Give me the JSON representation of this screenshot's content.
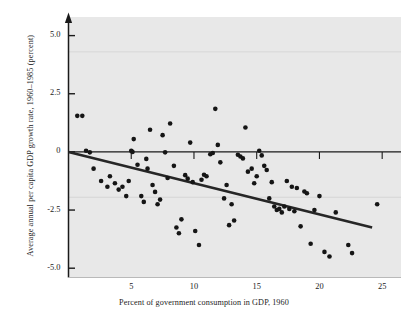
{
  "figure": {
    "background_color": "#ffffff",
    "plot_background_color": "#e8e8e8",
    "axis_color": "#1a1a1a",
    "point_color": "#151515",
    "trendline_color": "#262626",
    "gridline_color": "#d2d2d2"
  },
  "chart_data": {
    "type": "scatter",
    "title": "",
    "subtitle": "",
    "xlabel": "Percent of government consumption in GDP, 1960",
    "ylabel": "Average annual per capita GDP growth rate, 1960–1985 (percent)",
    "xlim": [
      0,
      26.5
    ],
    "ylim": [
      -5.4,
      5.8
    ],
    "xticks": [
      5,
      10,
      15,
      20,
      25
    ],
    "xtick_labels": [
      "5",
      "10",
      "15",
      "20",
      "25"
    ],
    "yticks": [
      5.0,
      2.5,
      0,
      -2.5,
      -5.0
    ],
    "ytick_labels": [
      "5.0",
      "2.5",
      "0",
      "-2.5",
      "-5.0"
    ],
    "grid": false,
    "faint_horizontal_gridlines_at": [
      4.3,
      -1.95
    ],
    "legend": null,
    "legend_position": "none",
    "zero_line": true,
    "y_axis_arrow": true,
    "annotations": [],
    "series": [
      {
        "name": "Countries",
        "marker": "filled-circle",
        "marker_size_px": 3.6,
        "points": [
          [
            0.7,
            1.55
          ],
          [
            1.1,
            1.55
          ],
          [
            1.4,
            0.05
          ],
          [
            1.7,
            -0.02
          ],
          [
            2.0,
            -0.72
          ],
          [
            2.6,
            -1.25
          ],
          [
            3.1,
            -1.5
          ],
          [
            3.3,
            -1.05
          ],
          [
            3.7,
            -1.35
          ],
          [
            4.0,
            -1.62
          ],
          [
            4.3,
            -1.5
          ],
          [
            4.6,
            -1.9
          ],
          [
            4.8,
            -1.25
          ],
          [
            5.0,
            0.05
          ],
          [
            5.1,
            0.0
          ],
          [
            5.2,
            0.55
          ],
          [
            5.5,
            -0.55
          ],
          [
            5.8,
            -1.9
          ],
          [
            6.0,
            -2.15
          ],
          [
            6.2,
            -0.3
          ],
          [
            6.3,
            -0.72
          ],
          [
            6.5,
            0.95
          ],
          [
            6.7,
            -1.42
          ],
          [
            6.9,
            -1.72
          ],
          [
            7.1,
            -2.25
          ],
          [
            7.3,
            -2.05
          ],
          [
            7.5,
            0.72
          ],
          [
            7.7,
            -0.02
          ],
          [
            7.9,
            -1.12
          ],
          [
            8.1,
            1.22
          ],
          [
            8.4,
            -0.6
          ],
          [
            8.6,
            -3.25
          ],
          [
            8.8,
            -3.5
          ],
          [
            9.0,
            -2.9
          ],
          [
            9.3,
            -1.0
          ],
          [
            9.5,
            -1.15
          ],
          [
            9.7,
            0.4
          ],
          [
            9.9,
            -1.3
          ],
          [
            10.1,
            -3.4
          ],
          [
            10.4,
            -4.0
          ],
          [
            10.6,
            -1.2
          ],
          [
            10.8,
            -0.98
          ],
          [
            11.0,
            -1.05
          ],
          [
            11.3,
            -0.1
          ],
          [
            11.5,
            -0.05
          ],
          [
            11.7,
            1.85
          ],
          [
            11.9,
            0.3
          ],
          [
            12.1,
            -0.45
          ],
          [
            12.4,
            -2.0
          ],
          [
            12.6,
            -1.42
          ],
          [
            12.8,
            -3.15
          ],
          [
            13.0,
            -2.25
          ],
          [
            13.2,
            -2.95
          ],
          [
            13.5,
            -0.12
          ],
          [
            13.7,
            -0.2
          ],
          [
            13.9,
            -0.28
          ],
          [
            14.1,
            1.05
          ],
          [
            14.3,
            -0.85
          ],
          [
            14.6,
            -0.72
          ],
          [
            14.8,
            -1.35
          ],
          [
            15.0,
            -1.05
          ],
          [
            15.2,
            0.05
          ],
          [
            15.4,
            -0.15
          ],
          [
            15.6,
            -0.6
          ],
          [
            15.8,
            -0.78
          ],
          [
            16.0,
            -2.0
          ],
          [
            16.2,
            -1.3
          ],
          [
            16.4,
            -2.35
          ],
          [
            16.6,
            -2.5
          ],
          [
            16.8,
            -2.45
          ],
          [
            17.0,
            -2.6
          ],
          [
            17.2,
            -2.35
          ],
          [
            17.4,
            -1.25
          ],
          [
            17.6,
            -2.45
          ],
          [
            17.8,
            -1.5
          ],
          [
            18.0,
            -2.55
          ],
          [
            18.2,
            -1.55
          ],
          [
            18.5,
            -3.2
          ],
          [
            18.8,
            -1.7
          ],
          [
            19.0,
            -1.78
          ],
          [
            19.3,
            -3.95
          ],
          [
            19.6,
            -2.5
          ],
          [
            20.0,
            -1.9
          ],
          [
            20.4,
            -4.3
          ],
          [
            20.8,
            -4.5
          ],
          [
            21.3,
            -2.6
          ],
          [
            22.3,
            -4.0
          ],
          [
            22.6,
            -4.35
          ],
          [
            24.6,
            -2.25
          ]
        ]
      }
    ],
    "trendline": {
      "name": "Fitted regression line",
      "x_start": 0,
      "y_start": 0.0,
      "x_end": 24.2,
      "y_end": -3.25,
      "slope": -0.134,
      "intercept": 0.0,
      "width_px": 2.6
    }
  }
}
